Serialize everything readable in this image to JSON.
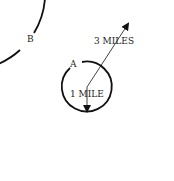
{
  "diagram": {
    "labels": {
      "outer_point": "B",
      "inner_point": "A",
      "outer_radius": "3 MILES",
      "inner_radius": "1 MILE"
    },
    "colors": {
      "stroke": "#111111",
      "background": "#ffffff"
    }
  }
}
